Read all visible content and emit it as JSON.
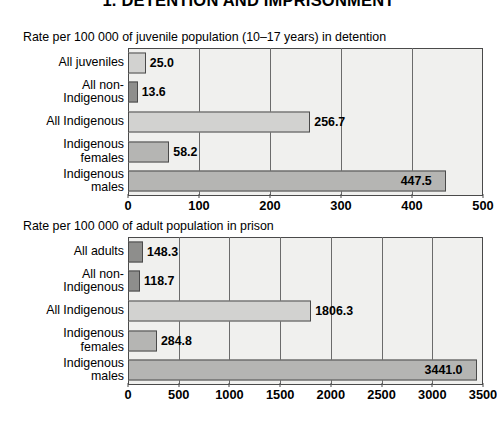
{
  "page": {
    "title": "1. DETENTION AND IMPRISONMENT"
  },
  "chart_data": [
    {
      "id": "juvenile-detention",
      "type": "bar",
      "orientation": "horizontal",
      "title": "Rate per 100 000 of juvenile population (10–17 years) in detention",
      "xlabel": "",
      "ylabel": "",
      "xlim": [
        0,
        500
      ],
      "xticks": [
        0,
        100,
        200,
        300,
        400,
        500
      ],
      "xtick_labels": [
        "0",
        "100",
        "200",
        "300",
        "400",
        "500"
      ],
      "grid": true,
      "legend": "none",
      "categories": [
        "All juveniles",
        "All non-\nIndigenous",
        "All Indigenous",
        "Indigenous\nfemales",
        "Indigenous\nmales"
      ],
      "values": [
        25.0,
        13.6,
        256.7,
        58.2,
        447.5
      ],
      "value_labels": [
        "25.0",
        "13.6",
        "256.7",
        "58.2",
        "447.5"
      ],
      "bar_shades": [
        "light",
        "dark",
        "light",
        "mid",
        "mid"
      ]
    },
    {
      "id": "adult-prison",
      "type": "bar",
      "orientation": "horizontal",
      "title": "Rate per 100 000 of adult population in prison",
      "xlabel": "",
      "ylabel": "",
      "xlim": [
        0,
        3500
      ],
      "xticks": [
        0,
        500,
        1000,
        1500,
        2000,
        2500,
        3000,
        3500
      ],
      "xtick_labels": [
        "0",
        "500",
        "1000",
        "1500",
        "2000",
        "2500",
        "3000",
        "3500"
      ],
      "grid": true,
      "legend": "none",
      "categories": [
        "All adults",
        "All non-\nIndigenous",
        "All Indigenous",
        "Indigenous\nfemales",
        "Indigenous\nmales"
      ],
      "values": [
        148.3,
        118.7,
        1806.3,
        284.8,
        3441.0
      ],
      "value_labels": [
        "148.3",
        "118.7",
        "1806.3",
        "284.8",
        "3441.0"
      ],
      "bar_shades": [
        "dark",
        "dark",
        "light",
        "mid",
        "mid"
      ]
    }
  ],
  "colors": {
    "plot_background": "#f0f0ee",
    "bar_light": "#d2d2d0",
    "bar_mid": "#b5b5b3",
    "bar_dark": "#8e8e8c",
    "axis": "#4a4a4a",
    "text": "#000000"
  }
}
